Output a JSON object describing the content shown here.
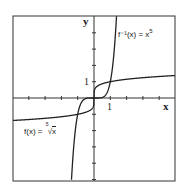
{
  "chart_data": {
    "type": "line",
    "title": "",
    "xlabel": "x",
    "ylabel": "y",
    "xlim": [
      -5,
      5
    ],
    "ylim": [
      -5,
      5
    ],
    "grid": false,
    "tick_labels": {
      "x": [
        "1"
      ],
      "y": [
        "1"
      ]
    },
    "series": [
      {
        "name": "f(x) = fifth root of x",
        "label": "f(x) = ⁵√x",
        "function": "x^(1/5)"
      },
      {
        "name": "f^-1(x) = x^5",
        "label": "f⁻¹(x) = x⁵",
        "function": "x^5"
      }
    ]
  },
  "labels": {
    "x_axis": "x",
    "y_axis": "y",
    "x_tick": "1",
    "y_tick": "1",
    "f_label_prefix": "f(x) = ",
    "f_label_root_index": "5",
    "f_label_radicand": "x",
    "finv_label_prefix": "f⁻¹(x) = x",
    "finv_label_exp": "5"
  }
}
